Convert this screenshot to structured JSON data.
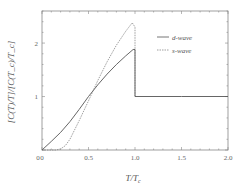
{
  "chart_data": {
    "type": "line",
    "title": "",
    "xlabel": "T/T_c",
    "ylabel": "[C(T)/T]/[C(T_c)/T_c]",
    "xlim": [
      0,
      2.0
    ],
    "ylim": [
      0,
      2.6
    ],
    "xticks": [
      "0",
      "0.5",
      "1.0",
      "1.5",
      "2.0"
    ],
    "yticks": [
      "0",
      "1",
      "2"
    ],
    "grid": false,
    "legend_position": "upper right",
    "series": [
      {
        "name": "d-wave",
        "style": "solid",
        "x": [
          0,
          0.1,
          0.2,
          0.3,
          0.4,
          0.5,
          0.6,
          0.7,
          0.8,
          0.9,
          0.98,
          1.0,
          1.0,
          1.5,
          2.0
        ],
        "y": [
          0,
          0.16,
          0.33,
          0.53,
          0.76,
          1.0,
          1.22,
          1.42,
          1.6,
          1.76,
          1.88,
          1.88,
          1.0,
          1.0,
          1.0
        ]
      },
      {
        "name": "s-wave",
        "style": "dashed",
        "x": [
          0,
          0.15,
          0.2,
          0.25,
          0.3,
          0.4,
          0.5,
          0.6,
          0.7,
          0.8,
          0.9,
          0.97,
          1.0,
          1.0
        ],
        "y": [
          0,
          0,
          0.02,
          0.08,
          0.2,
          0.55,
          0.92,
          1.3,
          1.65,
          1.96,
          2.22,
          2.38,
          2.3,
          1.0
        ]
      }
    ]
  }
}
